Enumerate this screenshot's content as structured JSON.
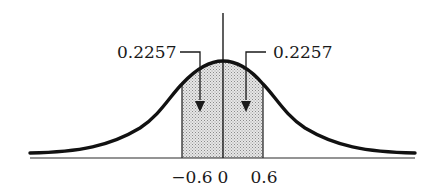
{
  "diagram": {
    "type": "normal-distribution-area",
    "curve": "standard normal bell curve",
    "shaded_region": {
      "from": -0.6,
      "to": 0.6
    },
    "annotations": {
      "left_area": "0.2257",
      "right_area": "0.2257"
    },
    "x_ticks": {
      "neg": "−0.6",
      "zero": "0",
      "pos": "0.6"
    },
    "colors": {
      "ink": "#1a1a1a",
      "shade": "#c8c8c8",
      "background": "#ffffff"
    }
  }
}
